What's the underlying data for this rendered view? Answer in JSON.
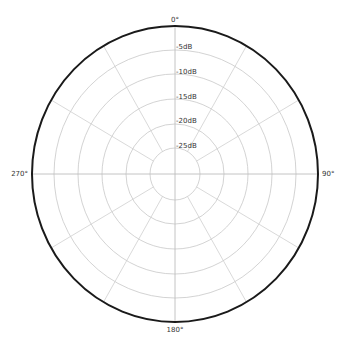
{
  "chart_data": {
    "type": "polar",
    "title": "",
    "angular_axis": {
      "unit": "degrees",
      "direction": "clockwise",
      "zero_at": "top",
      "tick_labels": [
        "0°",
        "90°",
        "180°",
        "270°"
      ],
      "spoke_interval_deg": 30
    },
    "radial_axis": {
      "unit": "dB",
      "tick_labels": [
        "-5dB",
        "-10dB",
        "-15dB",
        "-20dB",
        "-25dB"
      ],
      "tick_values": [
        -5,
        -10,
        -15,
        -20,
        -25
      ],
      "range": [
        -30,
        0
      ]
    },
    "series": [],
    "grid": true,
    "legend": null
  },
  "labels": {
    "angle_0": "0°",
    "angle_90": "90°",
    "angle_180": "180°",
    "angle_270": "270°",
    "r_5": "-5dB",
    "r_10": "-10dB",
    "r_15": "-15dB",
    "r_20": "-20dB",
    "r_25": "-25dB"
  },
  "colors": {
    "outline": "#1a1a1a",
    "grid": "#c8c8c8",
    "text": "#333333"
  }
}
